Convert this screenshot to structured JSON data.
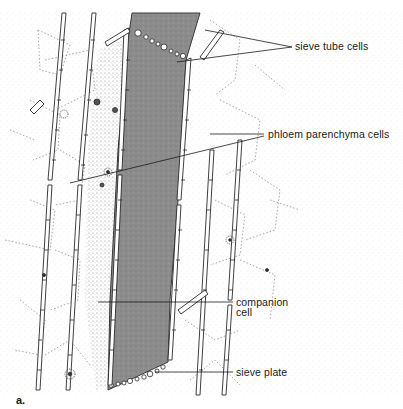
{
  "figure": {
    "panel_label": "a.",
    "colors": {
      "sieve_tube_fill": "#8a8a8a",
      "line": "#2a2a2a",
      "stipple": "#9a9a9a",
      "background": "#ffffff"
    },
    "labels": [
      {
        "id": "sieve-tube-cells",
        "text": "sieve tube cells"
      },
      {
        "id": "phloem-parenchyma-cells",
        "text": "phloem parenchyma cells"
      },
      {
        "id": "companion-cell",
        "lines": [
          "companion",
          "cell"
        ]
      },
      {
        "id": "sieve-plate",
        "text": "sieve plate"
      }
    ]
  }
}
